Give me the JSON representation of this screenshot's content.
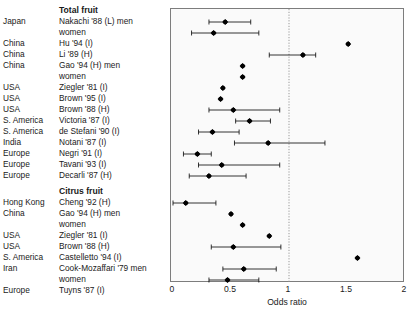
{
  "figure": {
    "background": "#ffffff",
    "plot_background": "#fafafa",
    "marker_color": "#000000",
    "border_color": "#7d7d7d",
    "reference_line_color": "#999999"
  },
  "axis": {
    "title": "Odds ratio",
    "ticks": [
      "0",
      "0.5",
      "1",
      "1.5",
      "2"
    ],
    "tick_values": [
      0,
      0.5,
      1,
      1.5,
      2
    ],
    "range": [
      0,
      2
    ],
    "reference_value": 1
  },
  "columns": {
    "region": "",
    "study": ""
  },
  "chart_data": {
    "type": "scatter",
    "title": "",
    "xlabel": "Odds ratio",
    "ylabel": "",
    "xlim": [
      0,
      2
    ],
    "grid": false,
    "legend": "none",
    "reference_line": 1,
    "groups": [
      {
        "name": "Total fruit",
        "rows": [
          {
            "region": "Japan",
            "study": "Nakachi '88 (L) men",
            "or": 0.45,
            "ci_low": 0.31,
            "ci_high": 0.67
          },
          {
            "region": "",
            "study": "women",
            "or": 0.35,
            "ci_low": 0.16,
            "ci_high": 0.74
          },
          {
            "region": "China",
            "study": "Hu '94 (I)",
            "or": 1.51,
            "ci_low": null,
            "ci_high": null
          },
          {
            "region": "China",
            "study": "Li '89 (H)",
            "or": 1.12,
            "ci_low": 0.83,
            "ci_high": 1.23
          },
          {
            "region": "China",
            "study": "Gao '94 (H) men",
            "or": 0.6,
            "ci_low": null,
            "ci_high": null
          },
          {
            "region": "",
            "study": "women",
            "or": 0.6,
            "ci_low": null,
            "ci_high": null
          },
          {
            "region": "USA",
            "study": "Ziegler '81 (I)",
            "or": 0.43,
            "ci_low": null,
            "ci_high": null
          },
          {
            "region": "USA",
            "study": "Brown '95 (I)",
            "or": 0.41,
            "ci_low": null,
            "ci_high": null
          },
          {
            "region": "USA",
            "study": "Brown '88 (H)",
            "or": 0.52,
            "ci_low": 0.31,
            "ci_high": 0.92
          },
          {
            "region": "S. America",
            "study": "Victoria '87 (I)",
            "or": 0.66,
            "ci_low": 0.54,
            "ci_high": 0.84
          },
          {
            "region": "S. America",
            "study": "de Stefani '90 (I)",
            "or": 0.34,
            "ci_low": 0.22,
            "ci_high": 0.57
          },
          {
            "region": "India",
            "study": "Notani '87 (I)",
            "or": 0.82,
            "ci_low": 0.53,
            "ci_high": 1.31
          },
          {
            "region": "Europe",
            "study": "Negri '91 (I)",
            "or": 0.21,
            "ci_low": 0.09,
            "ci_high": 0.33
          },
          {
            "region": "Europe",
            "study": "Tavani '93 (I)",
            "or": 0.42,
            "ci_low": 0.22,
            "ci_high": 0.92
          },
          {
            "region": "Europe",
            "study": "Decarli '87 (H)",
            "or": 0.31,
            "ci_low": 0.14,
            "ci_high": 0.63
          }
        ]
      },
      {
        "name": "Citrus fruit",
        "rows": [
          {
            "region": "Hong Kong",
            "study": "Cheng '92 (H)",
            "or": 0.11,
            "ci_low": 0.0,
            "ci_high": 0.37
          },
          {
            "region": "China",
            "study": "Gao '94 (H) men",
            "or": 0.5,
            "ci_low": null,
            "ci_high": null
          },
          {
            "region": "",
            "study": "women",
            "or": 0.6,
            "ci_low": null,
            "ci_high": null
          },
          {
            "region": "USA",
            "study": "Ziegler '81 (I)",
            "or": 0.83,
            "ci_low": null,
            "ci_high": null
          },
          {
            "region": "USA",
            "study": "Brown '88 (H)",
            "or": 0.52,
            "ci_low": 0.33,
            "ci_high": 0.93
          },
          {
            "region": "S. America",
            "study": "Castelletto '94 (I)",
            "or": 1.59,
            "ci_low": null,
            "ci_high": null
          },
          {
            "region": "Iran",
            "study": "Cook-Mozaffari '79 men",
            "or": 0.61,
            "ci_low": 0.43,
            "ci_high": 0.89
          },
          {
            "region": "",
            "study": "women",
            "or": 0.47,
            "ci_low": 0.31,
            "ci_high": 0.74
          },
          {
            "region": "Europe",
            "study": "Tuyns '87 (I)",
            "or": 0.35,
            "ci_low": null,
            "ci_high": null
          }
        ]
      }
    ]
  }
}
